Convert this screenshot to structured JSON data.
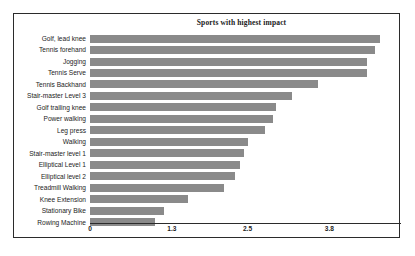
{
  "chart_data": {
    "type": "bar",
    "orientation": "horizontal",
    "title": "Sports with highest impact",
    "xlabel": "",
    "ylabel": "",
    "xlim": [
      0,
      4.92
    ],
    "xticks": [
      0,
      1.3,
      2.5,
      3.8
    ],
    "xticklabels": [
      "0",
      "1.3",
      "2.5",
      "3.8"
    ],
    "grid": false,
    "legend": null,
    "bar_color": "#8a8a8a",
    "categories": [
      "Golf, lead knee",
      "Tennis forehand",
      "Jogging",
      "Tennis Serve",
      "Tennis Backhand",
      "Stair-master Level 3",
      "Golf trailing knee",
      "Power walking",
      "Leg press",
      "Walking",
      "Stair-master level 1",
      "Elliptical Level 1",
      "Elliptical level 2",
      "Treadmill Walking",
      "Knee Extension",
      "Stationary Bike",
      "Rowing Machine"
    ],
    "values": [
      4.6,
      4.52,
      4.4,
      4.4,
      3.62,
      3.2,
      2.95,
      2.9,
      2.78,
      2.5,
      2.45,
      2.38,
      2.3,
      2.13,
      1.55,
      1.17,
      1.03
    ]
  },
  "frame": {
    "border_color": "#2b2b2b",
    "background": "#ffffff"
  }
}
